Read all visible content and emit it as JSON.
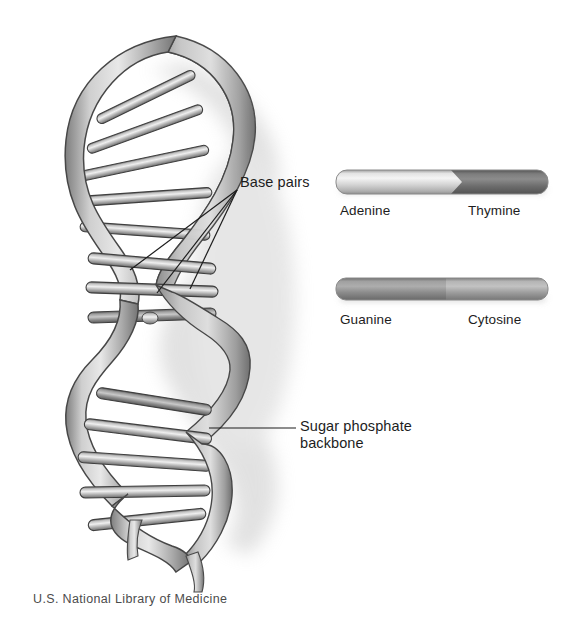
{
  "figure": {
    "credit": "U.S. National Library of Medicine",
    "background_color": "#ffffff",
    "ink_color": "#1d1d1d"
  },
  "annotations": {
    "base_pairs": {
      "label": "Base pairs",
      "leader_count": 3
    },
    "sugar_phosphate_backbone": {
      "line1": "Sugar phosphate",
      "line2": "backbone",
      "leader_count": 1
    }
  },
  "base_pair_legend": [
    {
      "id": "adenine-thymine",
      "left_label": "Adenine",
      "right_label": "Thymine",
      "left_color": "#d8d8d8",
      "right_color": "#6e6e6e",
      "split_fraction": 0.55,
      "junction": "pointed"
    },
    {
      "id": "guanine-cytosine",
      "left_label": "Guanine",
      "right_label": "Cytosine",
      "left_color": "#8d8d8d",
      "right_color": "#a3a3a3",
      "split_fraction": 0.5,
      "junction": "straight"
    }
  ],
  "helix": {
    "strand_color": "#9a9a9a",
    "strand_outline": "#4a4a4a",
    "rung_color": "#b3b3b3",
    "shadow_color": "#c9c9c9",
    "turns": 3
  }
}
